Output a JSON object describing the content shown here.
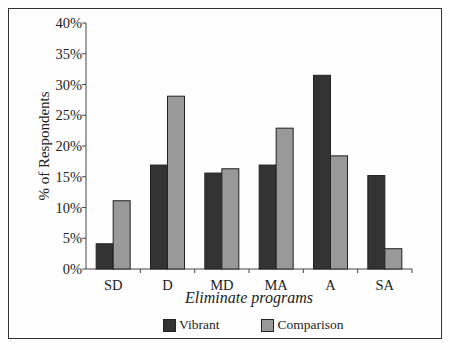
{
  "chart_data": {
    "type": "bar",
    "title": "",
    "xlabel": "Eliminate programs",
    "ylabel": "% of Respondents",
    "categories": [
      "SD",
      "D",
      "MD",
      "MA",
      "A",
      "SA"
    ],
    "series": [
      {
        "name": "Vibrant",
        "color": "#333333",
        "values": [
          4.1,
          16.9,
          15.6,
          16.9,
          31.5,
          15.2
        ]
      },
      {
        "name": "Comparison",
        "color": "#999999",
        "values": [
          11.1,
          28.1,
          16.3,
          22.9,
          18.4,
          3.3
        ]
      }
    ],
    "yticks": [
      "0%",
      "5%",
      "10%",
      "15%",
      "20%",
      "25%",
      "30%",
      "35%",
      "40%"
    ],
    "ylim": [
      0,
      40
    ],
    "grid": false,
    "legend_position": "bottom"
  },
  "legend": {
    "items": [
      {
        "label": "Vibrant",
        "color": "#333333"
      },
      {
        "label": "Comparison",
        "color": "#999999"
      }
    ]
  }
}
